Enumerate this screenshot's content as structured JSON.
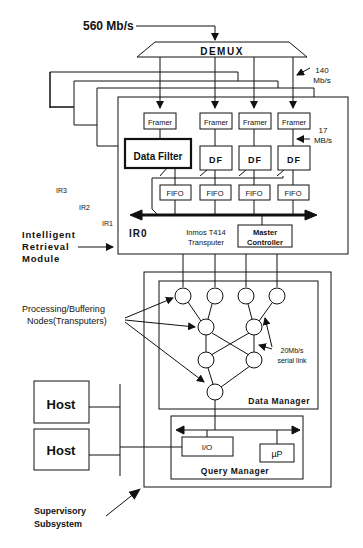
{
  "input_rate": "560 Mb/s",
  "demux": "DEMUX",
  "rate_140": [
    "140",
    "Mb/s"
  ],
  "rate_17": [
    "17",
    "MB/s"
  ],
  "framers": [
    "Framer",
    "Framer",
    "Framer",
    "Framer"
  ],
  "data_filter": "Data Filter",
  "df_labels": [
    "DF",
    "DF",
    "DF"
  ],
  "fifos": [
    "FIFO",
    "FIFO",
    "FIFO",
    "FIFO"
  ],
  "ir_labels": [
    "IR3",
    "IR2",
    "IR1",
    "IR0"
  ],
  "transputer": [
    "Inmos T414",
    "Transputer"
  ],
  "master_controller": [
    "Master",
    "Controller"
  ],
  "irm_label": [
    "Intelligent",
    "Retrieval",
    "Module"
  ],
  "nodes_label": [
    "Processing/Buffering",
    "Nodes(Transputers)"
  ],
  "serial_link": [
    "20Mb/s",
    "serial link"
  ],
  "data_manager": "Data Manager",
  "hosts": [
    "Host",
    "Host"
  ],
  "io": "I/O",
  "up": "µP",
  "query_manager": "Query Manager",
  "supervisory": [
    "Supervisory",
    "Subsystem"
  ]
}
